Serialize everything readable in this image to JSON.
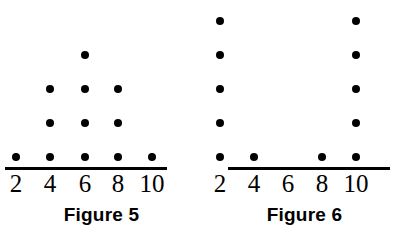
{
  "chart_data": [
    {
      "type": "bar",
      "plot_style": "dot-plot",
      "title": "Figure 5",
      "caption": "Figure 5",
      "categories": [
        "2",
        "4",
        "6",
        "8",
        "10"
      ],
      "values": [
        1,
        3,
        4,
        3,
        1
      ],
      "xlabel": "",
      "ylabel": "",
      "ylim": [
        0,
        4
      ],
      "grid": false,
      "legend": "none",
      "dot_color": "#000000",
      "axis_color": "#000000",
      "shape_description": "symmetric mound / pyramid distribution",
      "total_dots": 12,
      "tick_labels": [
        "2",
        "4",
        "6",
        "8",
        "10"
      ]
    },
    {
      "type": "bar",
      "plot_style": "dot-plot",
      "title": "Figure 6",
      "caption": "Figure 6",
      "categories": [
        "2",
        "4",
        "6",
        "8",
        "10"
      ],
      "values": [
        5,
        1,
        0,
        1,
        5
      ],
      "xlabel": "",
      "ylabel": "",
      "ylim": [
        0,
        5
      ],
      "grid": false,
      "legend": "none",
      "dot_color": "#000000",
      "axis_color": "#000000",
      "shape_description": "U-shaped / bimodal distribution",
      "total_dots": 12,
      "tick_labels": [
        "2",
        "4",
        "6",
        "8",
        "10"
      ]
    }
  ],
  "figures": [
    {
      "caption": "Figure 5",
      "ticks": [
        "2",
        "4",
        "6",
        "8",
        "10"
      ],
      "counts": [
        1,
        3,
        4,
        3,
        1
      ]
    },
    {
      "caption": "Figure 6",
      "ticks": [
        "2",
        "4",
        "6",
        "8",
        "10"
      ],
      "counts": [
        5,
        1,
        0,
        1,
        5
      ]
    }
  ]
}
